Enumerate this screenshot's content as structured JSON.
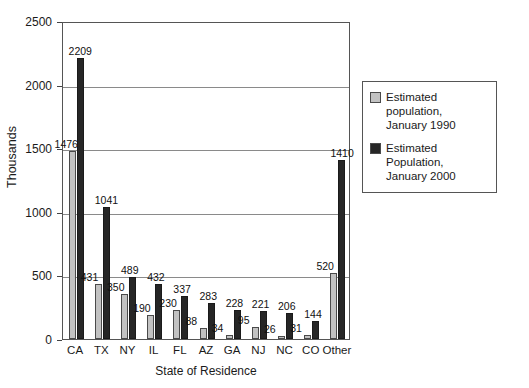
{
  "chart_data": {
    "type": "bar",
    "title": "",
    "xlabel": "State of Residence",
    "ylabel": "Thousands",
    "ylim": [
      0,
      2500
    ],
    "yticks": [
      0,
      500,
      1000,
      1500,
      2000,
      2500
    ],
    "ytick_labels": [
      "0",
      "500",
      "1000",
      "1500",
      "2000",
      "2500"
    ],
    "grid": true,
    "legend_position": "right",
    "categories": [
      "CA",
      "TX",
      "NY",
      "IL",
      "FL",
      "AZ",
      "GA",
      "NJ",
      "NC",
      "CO",
      "Other"
    ],
    "series": [
      {
        "name": "Estimated population, January 1990",
        "color": "#c2c2c2",
        "values": [
          1476,
          431,
          350,
          190,
          230,
          88,
          34,
          95,
          26,
          31,
          520
        ]
      },
      {
        "name": "Estimated Population, January 2000",
        "color": "#262626",
        "values": [
          2209,
          1041,
          489,
          432,
          337,
          283,
          228,
          221,
          206,
          144,
          1410
        ]
      }
    ]
  },
  "legend": {
    "entries": [
      {
        "label_line1": "Estimated population,",
        "label_line2": "January 1990",
        "swatch": "light-gray-swatch"
      },
      {
        "label_line1": "Estimated Population,",
        "label_line2": "January 2000",
        "swatch": "dark-swatch"
      }
    ]
  }
}
